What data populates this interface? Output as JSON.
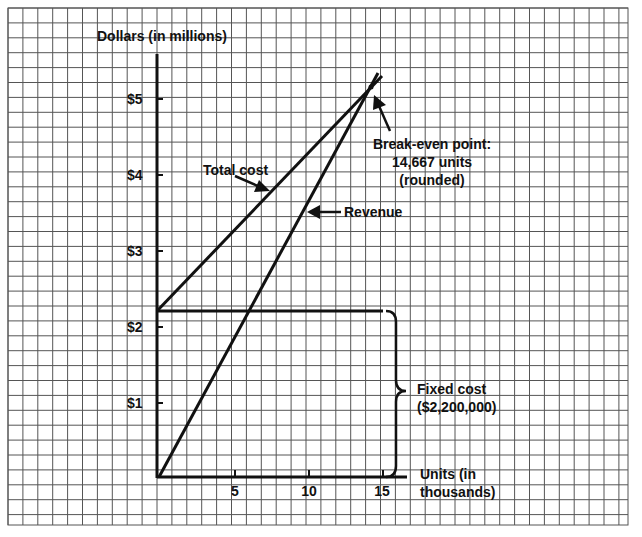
{
  "chart_data": {
    "type": "line",
    "xlabel": "Units (in thousands)",
    "ylabel": "Dollars (in millions)",
    "xlim": [
      0,
      16
    ],
    "ylim": [
      0,
      5.5
    ],
    "x_ticks": [
      5,
      10,
      15
    ],
    "y_ticks": [
      {
        "value": 1,
        "label": "$1"
      },
      {
        "value": 2,
        "label": "$2"
      },
      {
        "value": 3,
        "label": "$3"
      },
      {
        "value": 4,
        "label": "$4"
      },
      {
        "value": 5,
        "label": "$5"
      }
    ],
    "grid": true,
    "series": [
      {
        "name": "Total cost",
        "x": [
          0,
          14.667,
          14.9
        ],
        "y": [
          2.2,
          5.13,
          5.17
        ]
      },
      {
        "name": "Revenue",
        "x": [
          0,
          14.667,
          14.9
        ],
        "y": [
          0,
          5.13,
          5.21
        ]
      },
      {
        "name": "Fixed cost",
        "x": [
          0,
          15
        ],
        "y": [
          2.2,
          2.2
        ]
      }
    ],
    "annotations": [
      {
        "text": "Total cost",
        "points_to": "Total cost line"
      },
      {
        "text": "Revenue",
        "points_to": "Revenue line"
      },
      {
        "text": "Break-even point: 14,667 units (rounded)",
        "x": 14.667,
        "y": 5.13
      },
      {
        "text": "Fixed cost ($2,200,000)",
        "type": "brace",
        "y_range": [
          0,
          2.2
        ]
      }
    ]
  },
  "labels": {
    "y_axis_title": "Dollars (in millions)",
    "y_ticks": [
      "$5",
      "$4",
      "$3",
      "$2",
      "$1"
    ],
    "x_ticks": [
      "5",
      "10",
      "15"
    ],
    "x_axis_title_line1": "Units (in",
    "x_axis_title_line2": "thousands)",
    "total_cost": "Total cost",
    "revenue": "Revenue",
    "break_even_line1": "Break-even point:",
    "break_even_line2": "14,667 units",
    "break_even_line3": "(rounded)",
    "fixed_cost_line1": "Fixed cost",
    "fixed_cost_line2": "($2,200,000)"
  },
  "colors": {
    "grid": "#555555",
    "ink": "#111111",
    "background": "#ffffff"
  }
}
